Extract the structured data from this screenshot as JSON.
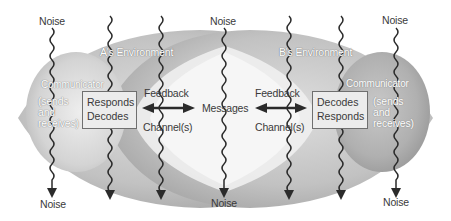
{
  "diagram": {
    "noise_label": "Noise",
    "noise_top": [
      {
        "label": "Noise",
        "x": 52
      },
      {
        "label": "Noise",
        "x": 224
      },
      {
        "label": "Noise",
        "x": 396
      }
    ],
    "noise_bottom": [
      {
        "label": "Noise",
        "x": 52
      },
      {
        "label": "Noise",
        "x": 224
      },
      {
        "label": "Noise",
        "x": 396
      }
    ],
    "environments": {
      "a": {
        "label": "A's Environment"
      },
      "b": {
        "label": "B's Environment"
      }
    },
    "communicator_a": {
      "label": "Communicator",
      "role": "(sends\nand\nreceives)",
      "box_lines": [
        "Responds",
        "Decodes"
      ]
    },
    "communicator_b": {
      "label": "Communicator",
      "role": "(sends\nand\nreceives)",
      "box_lines": [
        "Decodes",
        "Responds"
      ]
    },
    "left_link": {
      "top": "Feedback",
      "bottom": "Channel(s)"
    },
    "right_link": {
      "top": "Feedback",
      "bottom": "Channel(s)"
    },
    "center": {
      "label": "Messages"
    },
    "colors": {
      "environment_gray": "#b9b9b9",
      "communicator_gray": "#cfcfcf",
      "overlap_light": "#ececec",
      "line": "#2b2b2b",
      "text": "#3a3a3a"
    }
  }
}
